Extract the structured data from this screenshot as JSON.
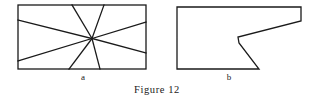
{
  "figure": {
    "caption": "Figure 12",
    "panels": [
      {
        "id": "a",
        "label": "a",
        "shape": "rectangle-with-radiating-lines",
        "description": "Rectangle crossed by four straight lines meeting at one interior point"
      },
      {
        "id": "b",
        "label": "b",
        "shape": "notched-polygon",
        "description": "Polygon with a concave notch cut into its right portion"
      }
    ],
    "style": {
      "stroke_color": "#1a1a1a",
      "background_color": "#ffffff",
      "stroke_width": 1.3
    }
  },
  "geometry": {
    "panel_a": {
      "rectangle": {
        "x": 18,
        "y": 5,
        "width": 128,
        "height": 64
      },
      "hub": {
        "x": 92,
        "y": 38.5
      },
      "rays": [
        {
          "name": "ray-to-left-upper",
          "x": 18,
          "y": 20
        },
        {
          "name": "ray-to-left-lower",
          "x": 18,
          "y": 61
        },
        {
          "name": "ray-to-right-upper",
          "x": 146,
          "y": 22
        },
        {
          "name": "ray-to-right-lower",
          "x": 146,
          "y": 53
        },
        {
          "name": "ray-to-top-left",
          "x": 72,
          "y": 5
        },
        {
          "name": "ray-to-top-right",
          "x": 104,
          "y": 5
        },
        {
          "name": "ray-to-bottom-left",
          "x": 69,
          "y": 69
        },
        {
          "name": "ray-to-bottom-right",
          "x": 100,
          "y": 69
        }
      ]
    },
    "panel_b": {
      "outline": [
        {
          "x": 177,
          "y": 7
        },
        {
          "x": 301,
          "y": 7
        },
        {
          "x": 301,
          "y": 21
        },
        {
          "x": 238,
          "y": 37
        },
        {
          "x": 239,
          "y": 43
        },
        {
          "x": 259,
          "y": 69
        },
        {
          "x": 177,
          "y": 69
        }
      ]
    }
  }
}
